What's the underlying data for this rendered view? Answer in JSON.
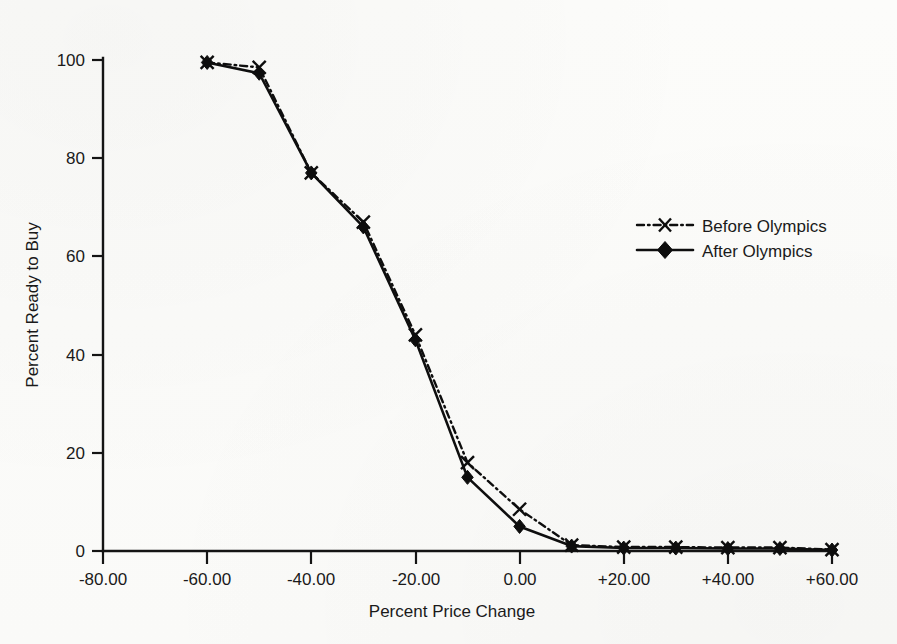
{
  "figure": {
    "background_color": "#fbfbf9",
    "ink_color": "#111111"
  },
  "axes": {
    "x_title": "Percent Price Change",
    "y_title": "Percent Ready to Buy",
    "x_ticks": [
      "-80.00",
      "-60.00",
      "-40.00",
      "-20.00",
      "0.00",
      "+20.00",
      "+40.00",
      "+60.00"
    ],
    "y_ticks": [
      "0",
      "20",
      "40",
      "60",
      "80",
      "100"
    ]
  },
  "legend": {
    "items": [
      {
        "label": "Before Olympics",
        "marker": "x-marker",
        "line_style": "dash-dot"
      },
      {
        "label": "After Olympics",
        "marker": "diamond-marker",
        "line_style": "solid"
      }
    ]
  },
  "chart_data": {
    "type": "line",
    "title": "",
    "subtitle": "",
    "xlabel": "Percent Price Change",
    "ylabel": "Percent Ready to Buy",
    "xlim": [
      -80,
      60
    ],
    "ylim": [
      0,
      100
    ],
    "xticks": [
      -80,
      -60,
      -40,
      -20,
      0,
      20,
      40,
      60
    ],
    "xticklabels": [
      "-80.00",
      "-60.00",
      "-40.00",
      "-20.00",
      "0.00",
      "+20.00",
      "+40.00",
      "+60.00"
    ],
    "yticks": [
      0,
      20,
      40,
      60,
      80,
      100
    ],
    "yticklabels": [
      "0",
      "20",
      "40",
      "60",
      "80",
      "100"
    ],
    "grid": false,
    "legend_position": "center-right",
    "x": [
      -60,
      -50,
      -40,
      -30,
      -20,
      -10,
      0,
      10,
      20,
      30,
      40,
      50,
      60
    ],
    "series": [
      {
        "name": "Before Olympics",
        "line_style": "dash-dot",
        "marker": "x",
        "values": [
          99.5,
          98.5,
          77,
          67,
          44,
          18,
          8.5,
          1.2,
          0.8,
          0.8,
          0.7,
          0.7,
          0.3
        ]
      },
      {
        "name": "After Olympics",
        "line_style": "solid",
        "marker": "diamond",
        "values": [
          99.5,
          97.3,
          77,
          66,
          43,
          15,
          5,
          1.0,
          0.6,
          0.6,
          0.5,
          0.5,
          0.2
        ]
      }
    ]
  }
}
